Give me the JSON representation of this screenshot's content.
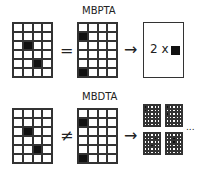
{
  "rows": [
    {
      "label": "MBPTA",
      "relation": "=",
      "arrow": "→",
      "source_grid": {
        "cols": 4,
        "rows": 6,
        "filled": [
          [
            1,
            2
          ],
          [
            2,
            4
          ]
        ]
      },
      "target_grid": {
        "cols": 4,
        "rows": 6,
        "filled": [
          [
            0,
            1
          ],
          [
            0,
            5
          ]
        ]
      },
      "result": {
        "text": "2 x",
        "icon": "filled-square"
      }
    },
    {
      "label": "MBDTA",
      "relation": "≠",
      "arrow": "→",
      "source_grid": {
        "cols": 4,
        "rows": 6,
        "filled": [
          [
            1,
            2
          ],
          [
            2,
            4
          ]
        ]
      },
      "target_grid": {
        "cols": 4,
        "rows": 6,
        "filled": [
          [
            0,
            1
          ],
          [
            0,
            5
          ]
        ]
      },
      "result_grids": [
        {
          "cols": 5,
          "rows": 6,
          "filled": [
            [
              0,
              0
            ],
            [
              0,
              1
            ]
          ]
        },
        {
          "cols": 5,
          "rows": 6,
          "filled": [
            [
              0,
              0
            ],
            [
              0,
              2
            ]
          ]
        },
        {
          "cols": 5,
          "rows": 6,
          "filled": [
            [
              3,
              1
            ],
            [
              2,
              3
            ]
          ]
        },
        {
          "cols": 5,
          "rows": 6,
          "filled": [
            [
              2,
              1
            ],
            [
              2,
              2
            ]
          ]
        }
      ],
      "ellipsis": "..."
    }
  ]
}
